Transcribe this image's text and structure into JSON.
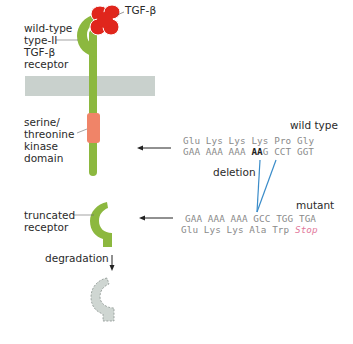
{
  "labels": {
    "receptor_wt": [
      "wild-type",
      "type-II",
      "TGF-β",
      "receptor"
    ],
    "ligand": "TGF-β",
    "kinase": [
      "serine/",
      "threonine",
      "kinase",
      "domain"
    ],
    "truncated": [
      "truncated",
      "receptor"
    ],
    "degradation": "degradation",
    "deletion": "deletion"
  },
  "wild_type": {
    "header": "wild type",
    "aa_line": [
      "Glu",
      "Lys",
      "Lys",
      "Lys",
      "Pro",
      "Gly"
    ],
    "codon_pre": "GAA AAA AAA ",
    "codon_deleted": "AA",
    "codon_post": "G CCT GGT"
  },
  "mutant": {
    "header": "mutant",
    "codon_line": "GAA AAA AAA GCC TGG TGA",
    "aa_pre": "Glu Lys Lys Ala Trp ",
    "aa_stop": "Stop"
  },
  "colors": {
    "receptor_green": "#8cb83f",
    "ligand_red": "#e0261c",
    "kinase_salmon": "#f08468",
    "membrane_gray": "#c9d1cd",
    "degraded_fill": "#cfd6d2",
    "deletion_blue": "#3a8cc9",
    "stop_pink": "#e27a9c"
  }
}
